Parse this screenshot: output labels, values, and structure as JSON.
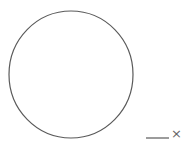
{
  "diagram": {
    "shapes": [
      {
        "type": "circle",
        "name": "main-circle",
        "cx": 71,
        "cy": 74.5,
        "rx": 62,
        "ry": 63.5,
        "stroke": "#5a5a5a",
        "stroke_width": 1.2,
        "fill": "none"
      },
      {
        "type": "line",
        "name": "segment",
        "x1": 146,
        "y1": 138,
        "x2": 169,
        "y2": 138,
        "stroke": "#5a5a5a",
        "stroke_width": 1.2
      }
    ],
    "labels": {
      "segment_label": "×"
    },
    "colors": {
      "background": "#ffffff",
      "stroke": "#5a5a5a",
      "label": "#666666"
    }
  }
}
